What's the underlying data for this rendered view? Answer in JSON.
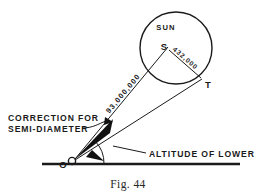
{
  "figure": {
    "caption": "Fig. 44",
    "background_color": "#ffffff",
    "ink_color": "#1a1a1a"
  },
  "labels": {
    "sun": "SUN",
    "sun_center_point": "S",
    "tangent_point": "T",
    "observer_point": "O",
    "earth_sun_distance": "93,000,000",
    "sun_radius": "432,000",
    "correction_line1": "CORRECTION FOR",
    "correction_line2": "SEMI-DIAMETER",
    "altitude_label": "ALTITUDE OF LOWER LIMB"
  },
  "geometry": {
    "sun_circle": {
      "cx": 176,
      "cy": 48,
      "r": 36
    },
    "sun_center_S": {
      "x": 168,
      "y": 47
    },
    "tangent_point_T": {
      "x": 202,
      "y": 79
    },
    "observer_O": {
      "x": 72,
      "y": 161
    },
    "horizon": {
      "x1": 42,
      "y1": 164,
      "x2": 240,
      "y2": 164
    },
    "altitude_arc_radius": 28,
    "semi_diameter_wedge": "filled black wedge between ray to S and ray to T at observer"
  }
}
